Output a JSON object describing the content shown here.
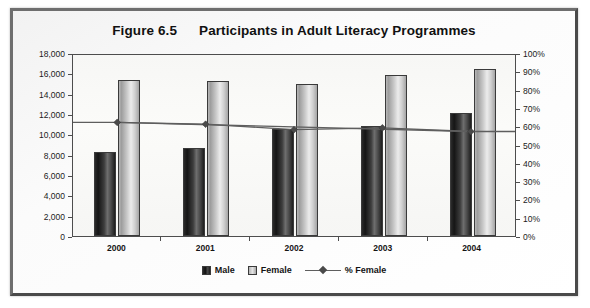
{
  "figure": {
    "number": "Figure 6.5",
    "title": "Participants in Adult Literacy Programmes"
  },
  "legend": {
    "male_label": "Male",
    "female_label": "Female",
    "pct_label": "% Female"
  },
  "colors": {
    "male": "#1d1d1d",
    "female": "#cfcfcf",
    "line": "#5e5e5e",
    "frame": "#5a5a5a",
    "plot_background": "#f8f8f6"
  },
  "chart_data": {
    "type": "bar",
    "xlabel": "",
    "ylabel": "",
    "categories": [
      "2000",
      "2001",
      "2002",
      "2003",
      "2004"
    ],
    "series": [
      {
        "name": "Male",
        "type": "bar",
        "axis": "left",
        "values": [
          8300,
          8700,
          10500,
          10800,
          12100
        ]
      },
      {
        "name": "Female",
        "type": "bar",
        "axis": "left",
        "values": [
          15300,
          15200,
          15000,
          15800,
          16400
        ]
      },
      {
        "name": "% Female",
        "type": "line",
        "axis": "right",
        "values": [
          63,
          62,
          59,
          60,
          58
        ]
      }
    ],
    "ylim": [
      0,
      18000
    ],
    "y2lim": [
      0,
      100
    ],
    "yticks": [
      "0",
      "2,000",
      "4,000",
      "6,000",
      "8,000",
      "10,000",
      "12,000",
      "14,000",
      "16,000",
      "18,000"
    ],
    "ytick_values": [
      0,
      2000,
      4000,
      6000,
      8000,
      10000,
      12000,
      14000,
      16000,
      18000
    ],
    "y2ticks": [
      "0%",
      "10%",
      "20%",
      "30%",
      "40%",
      "50%",
      "60%",
      "70%",
      "80%",
      "90%",
      "100%"
    ],
    "y2tick_values": [
      0,
      10,
      20,
      30,
      40,
      50,
      60,
      70,
      80,
      90,
      100
    ],
    "grid": false,
    "legend_position": "bottom"
  }
}
